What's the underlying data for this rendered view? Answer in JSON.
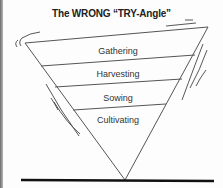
{
  "diagram": {
    "title": "The WRONG “TRY-Angle”",
    "shape": "inverted-triangle",
    "layers": [
      {
        "label": "Gathering",
        "order": 1
      },
      {
        "label": "Harvesting",
        "order": 2
      },
      {
        "label": "Sowing",
        "order": 3
      },
      {
        "label": "Cultivating",
        "order": 4
      }
    ],
    "colors": {
      "line": "#555555",
      "base_line": "#111111",
      "text": "#333333",
      "background": "#fdfdfd"
    }
  }
}
